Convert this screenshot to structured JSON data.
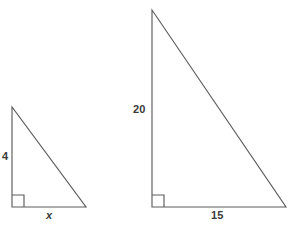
{
  "document": {
    "title": "Similar Right Triangles Diagram",
    "background_color": "#ffffff",
    "stroke_color": "#5c5c5c",
    "text_color": "#3a3a3a"
  },
  "figures": {
    "small_triangle": {
      "name": "small-right-triangle",
      "vertical_leg_label": "4",
      "base_leg_label": "x",
      "base_leg_label_style": "italic",
      "right_angle_marker": "right-angle-square",
      "apex_point": "12,107",
      "right_angle_point": "12,207",
      "base_end_point": "86,207"
    },
    "large_triangle": {
      "name": "large-right-triangle",
      "vertical_leg_label": "20",
      "base_leg_label": "15",
      "right_angle_marker": "right-angle-square",
      "apex_point": "152,10",
      "right_angle_point": "152,207",
      "base_end_point": "286,207"
    }
  },
  "caption": {
    "cropped_text": ""
  }
}
